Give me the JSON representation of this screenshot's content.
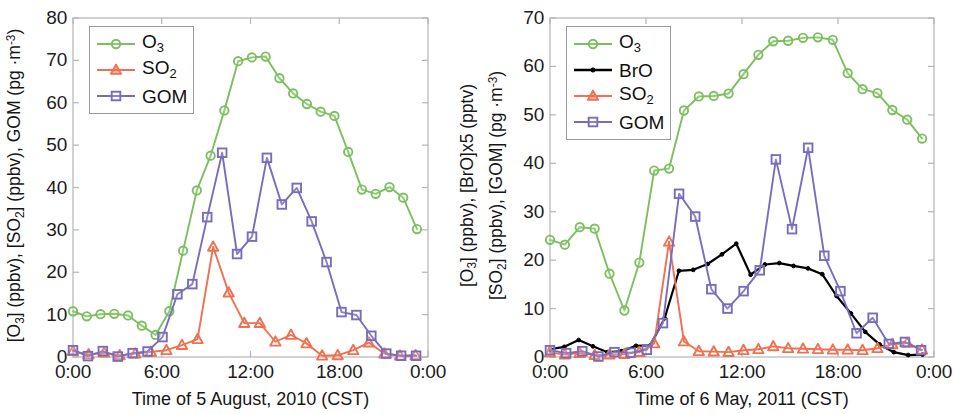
{
  "figure": {
    "background": "#ffffff"
  },
  "colors": {
    "o3": "#7cbf5e",
    "bro": "#000000",
    "so2": "#f0704f",
    "gom": "#7a6cbd",
    "axis": "#b5b5b5",
    "text": "#1a1a1a"
  },
  "panels": [
    {
      "id": "left",
      "xlabel": "Time of 5 August, 2010 (CST)",
      "ylabel_line1": "[O3] (ppbv), [SO2] (ppbv), GOM (pg ·m-3)",
      "yticks": [
        "0",
        "10",
        "20",
        "30",
        "40",
        "50",
        "60",
        "70",
        "80"
      ],
      "xticks": [
        "0:00",
        "6:00",
        "12:00",
        "18:00",
        "0:00"
      ],
      "legend": [
        {
          "label": "O3",
          "marker": "circle",
          "color_key": "o3"
        },
        {
          "label": "SO2",
          "marker": "triangle",
          "color_key": "so2"
        },
        {
          "label": "GOM",
          "marker": "square",
          "color_key": "gom"
        }
      ]
    },
    {
      "id": "right",
      "xlabel": "Time of 6 May, 2011 (CST)",
      "ylabel_line1": "[O3] (ppbv), [BrO]x5 (pptv)",
      "ylabel_line2": "[SO2] (ppbv), [GOM] (pg ·m-3)",
      "yticks": [
        "0",
        "10",
        "20",
        "30",
        "40",
        "50",
        "60",
        "70"
      ],
      "xticks": [
        "0:00",
        "6:00",
        "12:00",
        "18:00",
        "0:00"
      ],
      "legend": [
        {
          "label": "O3",
          "marker": "circle",
          "color_key": "o3"
        },
        {
          "label": "BrO",
          "marker": "dot",
          "color_key": "bro"
        },
        {
          "label": "SO2",
          "marker": "triangle",
          "color_key": "so2"
        },
        {
          "label": "GOM",
          "marker": "square",
          "color_key": "gom"
        }
      ]
    }
  ],
  "chart_data": [
    {
      "type": "line",
      "panel": "left",
      "title": "",
      "xlabel": "Time of 5 August, 2010 (CST)",
      "ylabel": "[O3] (ppbv), [SO2] (ppbv), GOM (pg m-3)",
      "xlim": [
        0,
        24
      ],
      "ylim": [
        0,
        80
      ],
      "yticks": [
        0,
        10,
        20,
        30,
        40,
        50,
        60,
        70,
        80
      ],
      "xticks": [
        0,
        6,
        12,
        18,
        24
      ],
      "xtick_labels": [
        "0:00",
        "6:00",
        "12:00",
        "18:00",
        "0:00"
      ],
      "grid": false,
      "legend_position": "upper-left",
      "x": [
        0,
        0.75,
        1.5,
        2.25,
        3,
        3.75,
        4.5,
        5.25,
        6,
        6.75,
        7.5,
        8.25,
        9,
        9.75,
        10.5,
        11.25,
        12,
        12.75,
        13.5,
        14.25,
        15,
        15.75,
        16.5,
        17.25,
        18,
        18.75,
        19.5,
        20.25,
        21,
        21.75,
        22.5,
        23.25
      ],
      "series": [
        {
          "name": "O3",
          "marker": "circle",
          "color": "#7cbf5e",
          "values": [
            10.8,
            9.6,
            10.1,
            10.2,
            9.8,
            7.4,
            5.2,
            10.8,
            25.1,
            39.3,
            47.5,
            58.2,
            69.8,
            70.7,
            70.9,
            65.8,
            62.2,
            59.7,
            57.9,
            56.9,
            48.4,
            39.5,
            38.5,
            40.1,
            37.6,
            30.2
          ]
        },
        {
          "name": "SO2",
          "marker": "triangle",
          "color": "#f0704f",
          "values": [
            1.4,
            0.6,
            1.0,
            0.4,
            0.8,
            1.2,
            1.6,
            2.8,
            4.2,
            26.0,
            15.2,
            8.0,
            8.0,
            3.6,
            5.2,
            3.2,
            0.3,
            0.4,
            1.6,
            3.4,
            0.8,
            0.3,
            0.4
          ]
        },
        {
          "name": "GOM",
          "marker": "square",
          "color": "#7a6cbd",
          "values": [
            1.6,
            0.2,
            1.4,
            0.1,
            0.9,
            1.3,
            4.7,
            14.8,
            17.2,
            33.0,
            48.2,
            24.3,
            28.4,
            47.0,
            36.0,
            39.9,
            32.0,
            22.4,
            10.6,
            9.9,
            5.0,
            0.8,
            0.3,
            0.3
          ]
        }
      ]
    },
    {
      "type": "line",
      "panel": "right",
      "title": "",
      "xlabel": "Time of 6 May, 2011 (CST)",
      "ylabel": "[O3] (ppbv), [BrO]x5 (pptv) / [SO2] (ppbv), [GOM] (pg m-3)",
      "xlim": [
        0,
        24
      ],
      "ylim": [
        0,
        70
      ],
      "yticks": [
        0,
        10,
        20,
        30,
        40,
        50,
        60,
        70
      ],
      "xticks": [
        0,
        6,
        12,
        18,
        24
      ],
      "xtick_labels": [
        "0:00",
        "6:00",
        "12:00",
        "18:00",
        "0:00"
      ],
      "grid": false,
      "legend_position": "upper-left",
      "x": [
        0,
        0.8,
        1.6,
        2.4,
        3.2,
        4,
        4.8,
        5.6,
        6.4,
        7.2,
        8,
        8.8,
        9.6,
        10.4,
        11.2,
        12,
        12.8,
        13.6,
        14.4,
        15.2,
        16,
        16.8,
        17.6,
        18.4,
        19.2,
        20,
        20.8,
        21.6,
        22.4,
        23.2
      ],
      "series": [
        {
          "name": "O3",
          "marker": "circle",
          "color": "#7cbf5e",
          "values": [
            24.2,
            23.2,
            26.8,
            26.5,
            17.2,
            9.6,
            19.5,
            38.5,
            38.9,
            50.9,
            53.8,
            53.9,
            54.4,
            58.4,
            62.4,
            65.2,
            65.3,
            65.9,
            66.0,
            65.5,
            58.6,
            55.3,
            54.5,
            51.0,
            49.0,
            45.1
          ]
        },
        {
          "name": "BrO",
          "marker": "dot",
          "color": "#000000",
          "values": [
            1.6,
            2.1,
            3.5,
            2.2,
            1.0,
            1.2,
            2.3,
            2.4,
            8.0,
            17.8,
            18.0,
            19.2,
            21.2,
            23.4,
            17.0,
            19.1,
            19.4,
            18.8,
            18.3,
            17.1,
            12.6,
            9.0,
            5.2,
            2.6,
            1.0,
            0.4,
            0.5
          ]
        },
        {
          "name": "SO2",
          "marker": "triangle",
          "color": "#f0704f",
          "values": [
            0.9,
            0.5,
            0.8,
            0.4,
            0.5,
            0.6,
            1.0,
            2.8,
            23.8,
            3.2,
            1.2,
            1.1,
            1.0,
            1.4,
            1.6,
            2.2,
            1.8,
            1.7,
            1.6,
            1.5,
            1.5,
            1.4,
            1.8,
            2.6,
            2.9,
            1.5
          ]
        },
        {
          "name": "GOM",
          "marker": "square",
          "color": "#7a6cbd",
          "values": [
            1.4,
            0.8,
            1.2,
            0.1,
            1.0,
            0.9,
            1.5,
            7.0,
            33.7,
            29.0,
            14.0,
            10.0,
            13.6,
            17.9,
            40.8,
            26.4,
            43.2,
            20.9,
            13.6,
            4.9,
            8.1,
            2.7,
            3.1,
            1.4
          ]
        }
      ]
    }
  ]
}
